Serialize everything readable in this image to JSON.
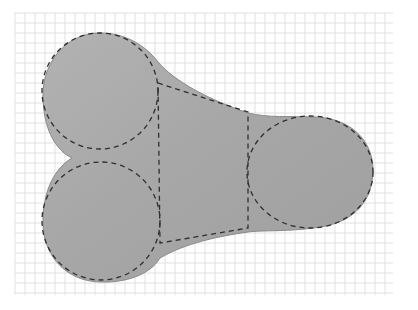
{
  "diagram": {
    "colors": {
      "background": "#ffffff",
      "grid_line": "#d9d9d9",
      "shape_fill": "#a9a9a9",
      "shape_edge": "#8a8a8a",
      "dashed_line": "#2e2e2e"
    },
    "grid": {
      "x_start": 15,
      "x_end": 393,
      "y_start": 13,
      "y_end": 295,
      "spacing": 10
    },
    "construction_shapes": [
      {
        "type": "circle",
        "name": "upper-left-circle",
        "cx": 100,
        "cy": 91,
        "r": 58
      },
      {
        "type": "circle",
        "name": "lower-left-circle",
        "cx": 101,
        "cy": 221,
        "r": 59
      },
      {
        "type": "ellipse",
        "name": "right-ellipse",
        "cx": 310,
        "cy": 172,
        "rx": 63,
        "ry": 56
      },
      {
        "type": "polygon",
        "name": "center-trapezoid",
        "points": [
          [
            158,
            83
          ],
          [
            248,
            112
          ],
          [
            248,
            228
          ],
          [
            160,
            243
          ]
        ]
      }
    ]
  }
}
